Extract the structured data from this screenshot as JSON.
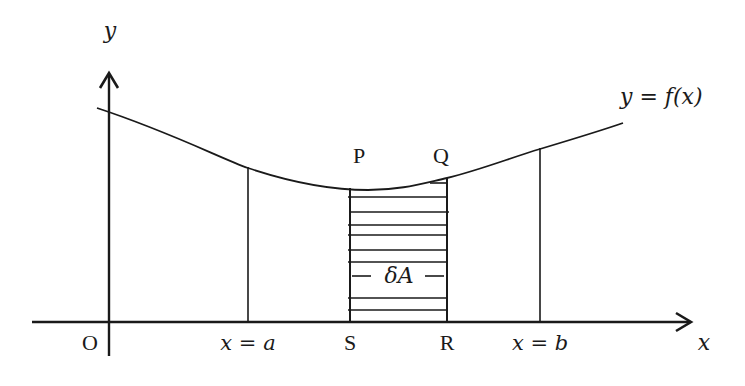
{
  "diagram": {
    "stroke_color": "#1a1a1a",
    "background": "#ffffff",
    "axes": {
      "y_label": "y",
      "x_label": "x",
      "origin_label": "O"
    },
    "curve": {
      "label": "y = f(x)",
      "points": [
        [
          97,
          108
        ],
        [
          160,
          130
        ],
        [
          248,
          168
        ],
        [
          300,
          182
        ],
        [
          350,
          188
        ],
        [
          368,
          190
        ],
        [
          400,
          187
        ],
        [
          447,
          178
        ],
        [
          500,
          162
        ],
        [
          540,
          149
        ],
        [
          590,
          134
        ],
        [
          623,
          123
        ]
      ]
    },
    "boundaries": {
      "left_label": "x = a",
      "right_label": "x = b"
    },
    "strip": {
      "top_left_label": "P",
      "top_right_label": "Q",
      "bottom_left_label": "S",
      "bottom_right_label": "R",
      "area_label": "δA",
      "hatch_y": [
        197,
        212,
        225,
        235,
        250,
        262,
        298,
        310
      ]
    }
  }
}
